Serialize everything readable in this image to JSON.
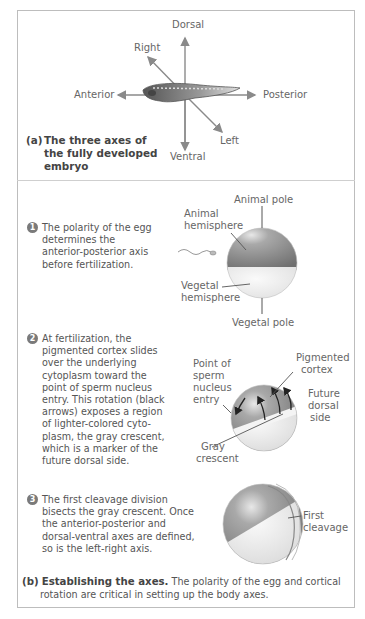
{
  "panel_a": {
    "axes": {
      "dorsal": "Dorsal",
      "ventral": "Ventral",
      "anterior": "Anterior",
      "posterior": "Posterior",
      "right": "Right",
      "left": "Left"
    },
    "caption_label": "(a)",
    "caption_lines": [
      "The three axes of",
      "the fully developed",
      "embryo"
    ]
  },
  "panel_b": {
    "steps": [
      {
        "number": "1",
        "lines": [
          "The polarity of the egg",
          "determines the",
          "anterior-posterior axis",
          "before fertilization."
        ],
        "labels": {
          "animal_pole": "Animal pole",
          "animal_hemisphere_1": "Animal",
          "animal_hemisphere_2": "hemisphere",
          "vegetal_hemisphere_1": "Vegetal",
          "vegetal_hemisphere_2": "hemisphere",
          "vegetal_pole": "Vegetal pole"
        }
      },
      {
        "number": "2",
        "lines": [
          "At fertilization, the",
          "pigmented cortex slides",
          "over the underlying",
          "cytoplasm toward the",
          "point of sperm nucleus",
          "entry. This rotation (black",
          "arrows) exposes a region",
          "of lighter-colored cyto-",
          "plasm, the gray crescent,",
          "which is a marker of the",
          "future dorsal side."
        ],
        "labels": {
          "point_1": "Point of",
          "point_2": "sperm",
          "point_3": "nucleus",
          "point_4": "entry",
          "pigmented_1": "Pigmented",
          "pigmented_2": "cortex",
          "future_1": "Future",
          "future_2": "dorsal",
          "future_3": "side",
          "gray_1": "Gray",
          "gray_2": "crescent"
        }
      },
      {
        "number": "3",
        "lines": [
          "The first cleavage division",
          "bisects the gray crescent. Once",
          "the anterior-posterior and",
          "dorsal-ventral axes are defined,",
          "so is the left-right axis."
        ],
        "labels": {
          "first_1": "First",
          "first_2": "cleavage"
        }
      }
    ],
    "caption_label": "(b)",
    "caption_title": "Establishing the axes.",
    "caption_text_1": " The polarity of the egg and cortical",
    "caption_text_2": "rotation are critical in setting up the body axes."
  },
  "colors": {
    "frame": "#bdbdbd",
    "arrow": "#8a8a8a",
    "animal_hemisphere": "#8c8c8c",
    "vegetal_hemisphere": "#ececec",
    "number_badge": "#7a7a7a"
  }
}
